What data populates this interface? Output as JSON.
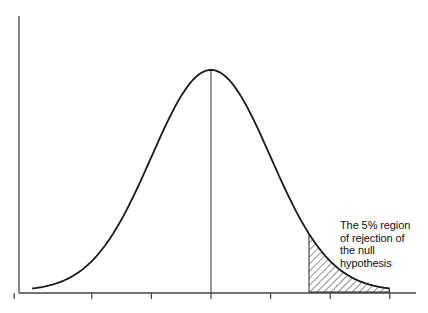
{
  "chart_data": {
    "type": "area",
    "title": "",
    "subtitle": "",
    "xlabel": "",
    "ylabel": "",
    "distribution": "normal",
    "mean": 0,
    "sd": 1,
    "x_ticks": [
      -3,
      -2,
      -1,
      0,
      1,
      2,
      3
    ],
    "x_tick_labels": [
      "",
      "",
      "",
      "",
      "",
      "",
      ""
    ],
    "xlim": [
      -3.3,
      3.4
    ],
    "ylim": [
      0,
      0.45
    ],
    "grid": false,
    "legend": null,
    "center_line_at": 0,
    "shaded_region": {
      "from": 1.645,
      "to": 3.0,
      "fill": "hatched",
      "label": "The 5% region of rejection of the null hypothesis"
    },
    "annotations": [
      {
        "text": "The 5% region\nof rejection of\nthe null\nhypothesis",
        "x": 2.2,
        "y": 0.13
      }
    ],
    "series": [
      {
        "name": "normal density",
        "x_range": [
          -3,
          3
        ],
        "peak_y": 0.399
      }
    ]
  },
  "annotation": {
    "text": "The 5% region\nof rejection of\nthe null\nhypothesis"
  },
  "colors": {
    "line": "#1a1a1a",
    "axis": "#333333",
    "background": "#ffffff"
  }
}
